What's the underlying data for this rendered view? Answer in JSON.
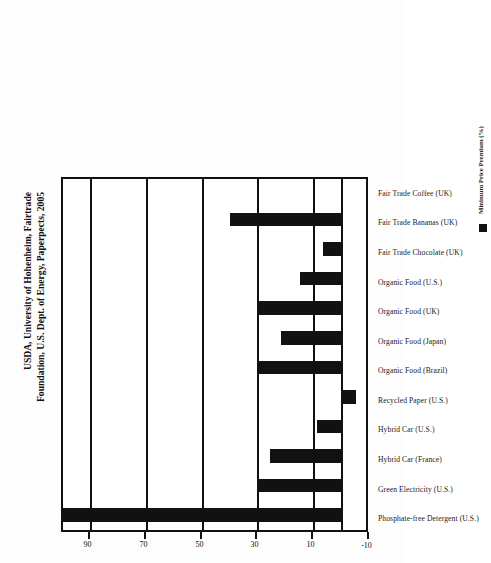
{
  "chart_data": {
    "type": "bar",
    "title": "",
    "subtitle": "",
    "xlabel": "",
    "ylabel": "Minimum Price Premium (%)",
    "orientation": "vertical-bars-on-rotated-page",
    "grid": true,
    "legend_position": "bottom-right",
    "ylim": [
      -10,
      100
    ],
    "yticks": [
      -10,
      10,
      30,
      50,
      70,
      90
    ],
    "ytick_labels": [
      "-10",
      "10",
      "30",
      "50",
      "70",
      "90"
    ],
    "categories": [
      "Phosphate-free Detergent (U.S.)",
      "Green Electricity (U.S.)",
      "Hybrid Car (France)",
      "Hybrid Car (U.S.)",
      "Recycled Paper (U.S.)",
      "Organic Food (Brazil)",
      "Organic Food (Japan)",
      "Organic Food (UK)",
      "Organic Food (U.S.)",
      "Fair Trade Chocolate (UK)",
      "Fair Trade Bananas (UK)",
      "Fair Trade Coffee (UK)"
    ],
    "series": [
      {
        "name": "Minimum Price Premium (%)",
        "color": "#111111",
        "values": [
          100,
          30,
          26,
          9,
          -5,
          30,
          22,
          30,
          15,
          7,
          40,
          0
        ]
      }
    ],
    "legend_entries": [
      "Minimum Price Premium (%)"
    ]
  },
  "legend": {
    "swatch_name": "series-color-swatch",
    "label": "Minimum Price Premium (%)"
  },
  "source": {
    "line1": "USDA, University of Hohenheim, Fairtrade",
    "line2": "Foundation, U.S. Dept. of Energy, Paperpects, 2005"
  }
}
